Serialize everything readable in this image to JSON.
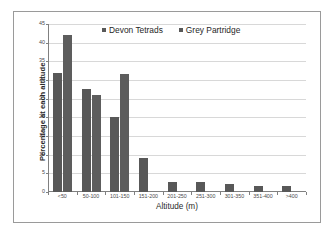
{
  "chart_data": {
    "type": "bar",
    "title": "",
    "xlabel": "Altitude (m)",
    "ylabel": "Percentage at each altitude",
    "categories": [
      "<50",
      "50-100",
      "101-150",
      "151-200",
      "201-250",
      "251-300",
      "301-350",
      "351-400",
      ">400"
    ],
    "series": [
      {
        "name": "Devon Tetrads",
        "color": "#585858",
        "values": [
          32,
          27.7,
          20,
          9,
          2.7,
          2.7,
          2.1,
          1.7,
          1.5
        ]
      },
      {
        "name": "Grey Partridge",
        "color": "#5d5d5d",
        "values": [
          42,
          26.1,
          31.5,
          0,
          0,
          0,
          0,
          0,
          0
        ]
      }
    ],
    "ylim": [
      0,
      45
    ],
    "yticks": [
      0,
      5,
      10,
      15,
      20,
      25,
      30,
      35,
      40,
      45
    ],
    "ytick_labels": [
      "0",
      "5",
      "10",
      "15",
      "20",
      "25",
      "30",
      "35",
      "40",
      "45"
    ],
    "grid": true,
    "legend_position": "top-center"
  },
  "legend": {
    "entries": [
      {
        "label": "Devon Tetrads",
        "swatch_icon": "square-swatch-icon"
      },
      {
        "label": "Grey Partridge",
        "swatch_icon": "square-swatch-icon"
      }
    ]
  }
}
